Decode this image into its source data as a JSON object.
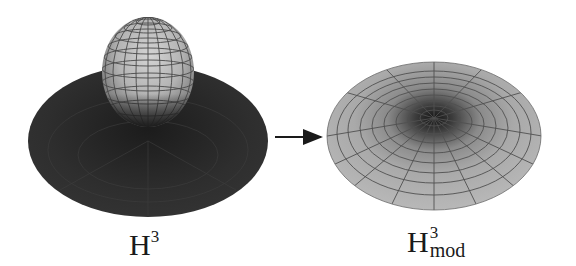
{
  "figure": {
    "left_panel": {
      "label_base": "H",
      "label_sup": "3",
      "description": "sphere atop dark disc"
    },
    "right_panel": {
      "label_base": "H",
      "label_sup": "3",
      "label_sub": "mod",
      "description": "flattened shaded dome with dark center"
    },
    "arrow": {
      "direction": "right"
    },
    "colors": {
      "background": "#ffffff",
      "disc_dark": "#2b2b2b",
      "sphere_light": "#c8c8c8",
      "sphere_mid": "#9a9a9a",
      "dome_light": "#b5b5b5",
      "dome_center": "#1e1e1e",
      "grid_line": "#4a4a4a",
      "arrow": "#1a1a1a"
    }
  }
}
